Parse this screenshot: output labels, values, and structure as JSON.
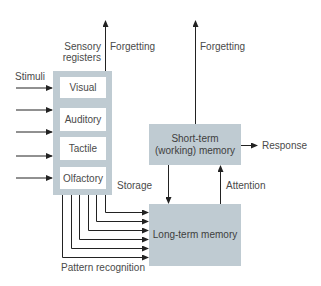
{
  "diagram": {
    "title_labels": {
      "sensory_registers_line1": "Sensory",
      "sensory_registers_line2": "registers",
      "forgetting_sensory": "Forgetting",
      "forgetting_short_term": "Forgetting",
      "stimuli": "Stimuli",
      "storage": "Storage",
      "attention": "Attention",
      "response": "Response",
      "pattern_recognition": "Pattern recognition"
    },
    "sensory_registers": [
      {
        "label": "Visual"
      },
      {
        "label": "Auditory"
      },
      {
        "label": "Tactile"
      },
      {
        "label": "Olfactory"
      }
    ],
    "short_term_memory": {
      "line1": "Short-term",
      "line2": "(working) memory"
    },
    "long_term_memory": {
      "label": "Long-term memory"
    },
    "colors": {
      "box_fill": "#bfcbd2",
      "inner_fill": "#ffffff",
      "line": "#222222",
      "text": "#4a4a4a"
    }
  }
}
